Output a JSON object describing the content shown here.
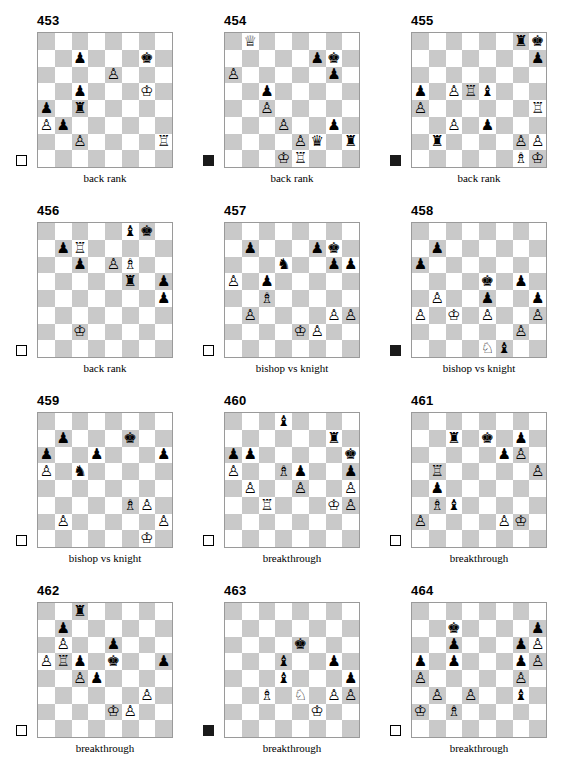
{
  "page": {
    "columns": 3,
    "rows": 4,
    "light_square_color": "#ffffff",
    "dark_square_color": "#c9c9c9",
    "border_color": "#9a9a9a"
  },
  "glyphs": {
    "white-king": "♔",
    "white-queen": "♕",
    "white-rook": "♖",
    "white-bishop": "♗",
    "white-knight": "♘",
    "white-pawn": "♙",
    "black-king": "♚",
    "black-queen": "♛",
    "black-rook": "♜",
    "black-bishop": "♝",
    "black-knight": "♞",
    "black-pawn": "♟"
  },
  "diagrams": [
    {
      "number": "453",
      "caption": "back rank",
      "side_to_move": "white",
      "pieces": [
        {
          "square": "c7",
          "piece": "black-pawn"
        },
        {
          "square": "g7",
          "piece": "black-king"
        },
        {
          "square": "e6",
          "piece": "white-pawn"
        },
        {
          "square": "g5",
          "piece": "white-king"
        },
        {
          "square": "c5",
          "piece": "black-pawn"
        },
        {
          "square": "a4",
          "piece": "black-pawn"
        },
        {
          "square": "c4",
          "piece": "black-rook"
        },
        {
          "square": "a3",
          "piece": "white-pawn"
        },
        {
          "square": "b3",
          "piece": "black-pawn"
        },
        {
          "square": "c2",
          "piece": "white-pawn"
        },
        {
          "square": "h2",
          "piece": "white-rook"
        }
      ]
    },
    {
      "number": "454",
      "caption": "back rank",
      "side_to_move": "black",
      "pieces": [
        {
          "square": "b8",
          "piece": "white-queen"
        },
        {
          "square": "f7",
          "piece": "black-pawn"
        },
        {
          "square": "g7",
          "piece": "black-king"
        },
        {
          "square": "a6",
          "piece": "white-pawn"
        },
        {
          "square": "g6",
          "piece": "black-pawn"
        },
        {
          "square": "c5",
          "piece": "black-pawn"
        },
        {
          "square": "c4",
          "piece": "white-pawn"
        },
        {
          "square": "d3",
          "piece": "white-pawn"
        },
        {
          "square": "g3",
          "piece": "black-pawn"
        },
        {
          "square": "e2",
          "piece": "white-pawn"
        },
        {
          "square": "f2",
          "piece": "black-queen"
        },
        {
          "square": "h2",
          "piece": "black-rook"
        },
        {
          "square": "d1",
          "piece": "white-king"
        },
        {
          "square": "e1",
          "piece": "white-rook"
        }
      ]
    },
    {
      "number": "455",
      "caption": "back rank",
      "side_to_move": "black",
      "pieces": [
        {
          "square": "g8",
          "piece": "black-rook"
        },
        {
          "square": "h8",
          "piece": "black-king"
        },
        {
          "square": "h7",
          "piece": "black-pawn"
        },
        {
          "square": "a5",
          "piece": "black-pawn"
        },
        {
          "square": "c5",
          "piece": "white-pawn"
        },
        {
          "square": "d5",
          "piece": "white-rook"
        },
        {
          "square": "e5",
          "piece": "black-bishop"
        },
        {
          "square": "a4",
          "piece": "white-pawn"
        },
        {
          "square": "h4",
          "piece": "white-rook"
        },
        {
          "square": "c3",
          "piece": "white-pawn"
        },
        {
          "square": "e3",
          "piece": "black-pawn"
        },
        {
          "square": "b2",
          "piece": "black-rook"
        },
        {
          "square": "g2",
          "piece": "white-pawn"
        },
        {
          "square": "h2",
          "piece": "white-pawn"
        },
        {
          "square": "g1",
          "piece": "white-bishop"
        },
        {
          "square": "h1",
          "piece": "white-king"
        }
      ]
    },
    {
      "number": "456",
      "caption": "back rank",
      "side_to_move": "white",
      "pieces": [
        {
          "square": "f8",
          "piece": "black-bishop"
        },
        {
          "square": "g8",
          "piece": "black-king"
        },
        {
          "square": "b7",
          "piece": "black-pawn"
        },
        {
          "square": "c7",
          "piece": "white-rook"
        },
        {
          "square": "c6",
          "piece": "black-pawn"
        },
        {
          "square": "e6",
          "piece": "white-pawn"
        },
        {
          "square": "f6",
          "piece": "white-bishop"
        },
        {
          "square": "f5",
          "piece": "black-rook"
        },
        {
          "square": "h5",
          "piece": "black-pawn"
        },
        {
          "square": "h4",
          "piece": "black-pawn"
        },
        {
          "square": "c2",
          "piece": "white-king"
        }
      ]
    },
    {
      "number": "457",
      "caption": "bishop vs knight",
      "side_to_move": "white",
      "pieces": [
        {
          "square": "b7",
          "piece": "black-pawn"
        },
        {
          "square": "f7",
          "piece": "black-pawn"
        },
        {
          "square": "g7",
          "piece": "black-king"
        },
        {
          "square": "d6",
          "piece": "black-knight"
        },
        {
          "square": "g6",
          "piece": "black-pawn"
        },
        {
          "square": "h6",
          "piece": "black-pawn"
        },
        {
          "square": "a5",
          "piece": "white-pawn"
        },
        {
          "square": "c5",
          "piece": "black-pawn"
        },
        {
          "square": "c4",
          "piece": "white-bishop"
        },
        {
          "square": "b3",
          "piece": "white-pawn"
        },
        {
          "square": "g3",
          "piece": "white-pawn"
        },
        {
          "square": "h3",
          "piece": "white-pawn"
        },
        {
          "square": "e2",
          "piece": "white-king"
        },
        {
          "square": "f2",
          "piece": "white-pawn"
        }
      ]
    },
    {
      "number": "458",
      "caption": "bishop vs knight",
      "side_to_move": "black",
      "pieces": [
        {
          "square": "b7",
          "piece": "black-pawn"
        },
        {
          "square": "a6",
          "piece": "black-pawn"
        },
        {
          "square": "e5",
          "piece": "black-king"
        },
        {
          "square": "g5",
          "piece": "black-pawn"
        },
        {
          "square": "b4",
          "piece": "white-pawn"
        },
        {
          "square": "e4",
          "piece": "black-pawn"
        },
        {
          "square": "h4",
          "piece": "black-pawn"
        },
        {
          "square": "a3",
          "piece": "white-pawn"
        },
        {
          "square": "c3",
          "piece": "white-king"
        },
        {
          "square": "e3",
          "piece": "white-pawn"
        },
        {
          "square": "h3",
          "piece": "white-pawn"
        },
        {
          "square": "g2",
          "piece": "white-pawn"
        },
        {
          "square": "e1",
          "piece": "white-knight"
        },
        {
          "square": "f1",
          "piece": "black-bishop"
        }
      ]
    },
    {
      "number": "459",
      "caption": "bishop vs knight",
      "side_to_move": "white",
      "pieces": [
        {
          "square": "b7",
          "piece": "black-pawn"
        },
        {
          "square": "f7",
          "piece": "black-king"
        },
        {
          "square": "a6",
          "piece": "black-pawn"
        },
        {
          "square": "d6",
          "piece": "black-pawn"
        },
        {
          "square": "h6",
          "piece": "black-pawn"
        },
        {
          "square": "a5",
          "piece": "white-pawn"
        },
        {
          "square": "c5",
          "piece": "black-knight"
        },
        {
          "square": "f3",
          "piece": "white-bishop"
        },
        {
          "square": "g3",
          "piece": "white-pawn"
        },
        {
          "square": "b2",
          "piece": "white-pawn"
        },
        {
          "square": "h2",
          "piece": "white-pawn"
        },
        {
          "square": "g1",
          "piece": "white-king"
        }
      ]
    },
    {
      "number": "460",
      "caption": "breakthrough",
      "side_to_move": "white",
      "pieces": [
        {
          "square": "d8",
          "piece": "black-bishop"
        },
        {
          "square": "g7",
          "piece": "black-rook"
        },
        {
          "square": "a6",
          "piece": "black-pawn"
        },
        {
          "square": "b6",
          "piece": "black-pawn"
        },
        {
          "square": "h6",
          "piece": "black-king"
        },
        {
          "square": "a5",
          "piece": "white-pawn"
        },
        {
          "square": "d5",
          "piece": "white-bishop"
        },
        {
          "square": "e5",
          "piece": "black-pawn"
        },
        {
          "square": "h5",
          "piece": "black-pawn"
        },
        {
          "square": "b4",
          "piece": "white-pawn"
        },
        {
          "square": "e4",
          "piece": "white-pawn"
        },
        {
          "square": "h4",
          "piece": "white-pawn"
        },
        {
          "square": "c3",
          "piece": "white-rook"
        },
        {
          "square": "g3",
          "piece": "white-king"
        },
        {
          "square": "h3",
          "piece": "white-pawn"
        }
      ]
    },
    {
      "number": "461",
      "caption": "breakthrough",
      "side_to_move": "white",
      "pieces": [
        {
          "square": "c7",
          "piece": "black-rook"
        },
        {
          "square": "e7",
          "piece": "black-king"
        },
        {
          "square": "g7",
          "piece": "black-pawn"
        },
        {
          "square": "f6",
          "piece": "black-pawn"
        },
        {
          "square": "g6",
          "piece": "white-pawn"
        },
        {
          "square": "b5",
          "piece": "white-rook"
        },
        {
          "square": "h5",
          "piece": "white-pawn"
        },
        {
          "square": "b4",
          "piece": "black-pawn"
        },
        {
          "square": "b3",
          "piece": "white-bishop"
        },
        {
          "square": "c3",
          "piece": "black-bishop"
        },
        {
          "square": "a2",
          "piece": "white-pawn"
        },
        {
          "square": "f2",
          "piece": "white-pawn"
        },
        {
          "square": "g2",
          "piece": "white-king"
        }
      ]
    },
    {
      "number": "462",
      "caption": "breakthrough",
      "side_to_move": "white",
      "pieces": [
        {
          "square": "c8",
          "piece": "black-rook"
        },
        {
          "square": "b7",
          "piece": "black-pawn"
        },
        {
          "square": "b6",
          "piece": "white-pawn"
        },
        {
          "square": "e6",
          "piece": "black-pawn"
        },
        {
          "square": "a5",
          "piece": "white-pawn"
        },
        {
          "square": "b5",
          "piece": "white-rook"
        },
        {
          "square": "c5",
          "piece": "black-pawn"
        },
        {
          "square": "e5",
          "piece": "black-king"
        },
        {
          "square": "h5",
          "piece": "black-pawn"
        },
        {
          "square": "c4",
          "piece": "white-pawn"
        },
        {
          "square": "d4",
          "piece": "black-pawn"
        },
        {
          "square": "g3",
          "piece": "white-pawn"
        },
        {
          "square": "e2",
          "piece": "white-king"
        },
        {
          "square": "f2",
          "piece": "white-pawn"
        }
      ]
    },
    {
      "number": "463",
      "caption": "breakthrough",
      "side_to_move": "black",
      "pieces": [
        {
          "square": "e6",
          "piece": "black-king"
        },
        {
          "square": "d5",
          "piece": "black-bishop"
        },
        {
          "square": "g5",
          "piece": "black-pawn"
        },
        {
          "square": "d4",
          "piece": "black-bishop"
        },
        {
          "square": "h4",
          "piece": "black-pawn"
        },
        {
          "square": "c3",
          "piece": "white-bishop"
        },
        {
          "square": "e3",
          "piece": "white-knight"
        },
        {
          "square": "g3",
          "piece": "white-pawn"
        },
        {
          "square": "h3",
          "piece": "white-pawn"
        },
        {
          "square": "f2",
          "piece": "white-king"
        }
      ]
    },
    {
      "number": "464",
      "caption": "breakthrough",
      "side_to_move": "white",
      "pieces": [
        {
          "square": "c7",
          "piece": "black-king"
        },
        {
          "square": "h7",
          "piece": "black-pawn"
        },
        {
          "square": "c6",
          "piece": "black-pawn"
        },
        {
          "square": "g6",
          "piece": "black-pawn"
        },
        {
          "square": "h6",
          "piece": "white-pawn"
        },
        {
          "square": "a5",
          "piece": "black-pawn"
        },
        {
          "square": "c5",
          "piece": "black-pawn"
        },
        {
          "square": "g5",
          "piece": "black-pawn"
        },
        {
          "square": "h5",
          "piece": "white-pawn"
        },
        {
          "square": "a4",
          "piece": "white-pawn"
        },
        {
          "square": "g4",
          "piece": "white-pawn"
        },
        {
          "square": "b3",
          "piece": "white-pawn"
        },
        {
          "square": "d3",
          "piece": "white-pawn"
        },
        {
          "square": "g3",
          "piece": "black-bishop"
        },
        {
          "square": "a2",
          "piece": "white-king"
        },
        {
          "square": "c2",
          "piece": "white-bishop"
        }
      ]
    }
  ]
}
